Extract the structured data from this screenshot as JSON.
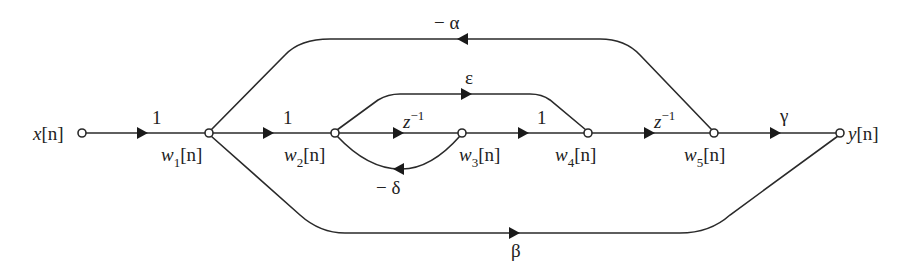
{
  "diagram": {
    "type": "signal-flow-graph",
    "nodes": [
      {
        "id": "x",
        "label": "x[n]",
        "name": "x",
        "sub": "",
        "x": 82,
        "y": 133
      },
      {
        "id": "w1",
        "label": "w1[n]",
        "name": "w",
        "sub": "1",
        "x": 209,
        "y": 133
      },
      {
        "id": "w2",
        "label": "w2[n]",
        "name": "w",
        "sub": "2",
        "x": 335,
        "y": 133
      },
      {
        "id": "w3",
        "label": "w3[n]",
        "name": "w",
        "sub": "3",
        "x": 462,
        "y": 133
      },
      {
        "id": "w4",
        "label": "w4[n]",
        "name": "w",
        "sub": "4",
        "x": 588,
        "y": 133
      },
      {
        "id": "w5",
        "label": "w5[n]",
        "name": "w",
        "sub": "5",
        "x": 714,
        "y": 133
      },
      {
        "id": "y",
        "label": "y[n]",
        "name": "y",
        "sub": "",
        "x": 840,
        "y": 133
      }
    ],
    "edges": [
      {
        "from": "x",
        "to": "w1",
        "gain": "1"
      },
      {
        "from": "w1",
        "to": "w2",
        "gain": "1"
      },
      {
        "from": "w2",
        "to": "w3",
        "gain": "z^-1"
      },
      {
        "from": "w3",
        "to": "w4",
        "gain": "1"
      },
      {
        "from": "w4",
        "to": "w5",
        "gain": "z^-1"
      },
      {
        "from": "w5",
        "to": "y",
        "gain": "γ"
      },
      {
        "from": "w2",
        "to": "w4",
        "gain": "ε"
      },
      {
        "from": "w3",
        "to": "w2",
        "gain": "− δ"
      },
      {
        "from": "w5",
        "to": "w1",
        "gain": "− α"
      },
      {
        "from": "w1",
        "to": "y",
        "gain": "β"
      }
    ],
    "labels": {
      "x_node": "x",
      "y_node": "y",
      "w_node": "w",
      "bracket_n": "[n]",
      "gain_one": "1",
      "gain_z": "z",
      "gain_z_exp": "−1",
      "gain_gamma": "γ",
      "gain_epsilon": "ε",
      "gain_delta": "− δ",
      "gain_alpha": "− α",
      "gain_beta": "β",
      "sub1": "1",
      "sub2": "2",
      "sub3": "3",
      "sub4": "4",
      "sub5": "5"
    }
  }
}
